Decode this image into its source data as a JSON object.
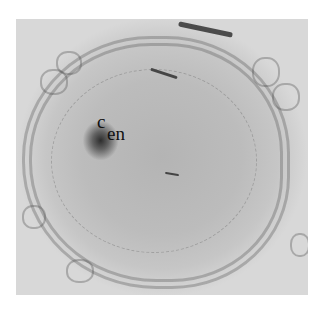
{
  "figure": {
    "type": "grayscale micrograph",
    "labels": {
      "c": "c",
      "en": "en"
    },
    "colors": {
      "background": "#ffffff",
      "tissue": "#bcbcbc",
      "stain": "#1a1a1a",
      "label_text": "#111111"
    }
  }
}
